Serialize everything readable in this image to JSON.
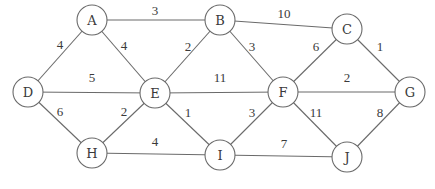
{
  "graph": {
    "type": "undirected-weighted",
    "node_radius": 15,
    "colors": {
      "stroke": "#6a6a6a",
      "text": "#3a3a3a",
      "background": "#ffffff"
    },
    "nodes": [
      {
        "id": "A",
        "x": 92,
        "y": 20
      },
      {
        "id": "B",
        "x": 220,
        "y": 20
      },
      {
        "id": "C",
        "x": 347,
        "y": 29
      },
      {
        "id": "D",
        "x": 28,
        "y": 92
      },
      {
        "id": "E",
        "x": 155,
        "y": 93
      },
      {
        "id": "F",
        "x": 283,
        "y": 92
      },
      {
        "id": "G",
        "x": 410,
        "y": 92
      },
      {
        "id": "H",
        "x": 92,
        "y": 153
      },
      {
        "id": "I",
        "x": 220,
        "y": 155
      },
      {
        "id": "J",
        "x": 347,
        "y": 157
      }
    ],
    "edges": [
      {
        "from": "A",
        "to": "B",
        "weight": "3",
        "lx": 155,
        "ly": 15
      },
      {
        "from": "A",
        "to": "D",
        "weight": "4",
        "lx": 60,
        "ly": 49
      },
      {
        "from": "A",
        "to": "E",
        "weight": "4",
        "lx": 124,
        "ly": 50
      },
      {
        "from": "B",
        "to": "C",
        "weight": "10",
        "lx": 284,
        "ly": 18
      },
      {
        "from": "B",
        "to": "E",
        "weight": "2",
        "lx": 188,
        "ly": 51
      },
      {
        "from": "B",
        "to": "F",
        "weight": "3",
        "lx": 252,
        "ly": 51
      },
      {
        "from": "C",
        "to": "F",
        "weight": "6",
        "lx": 316,
        "ly": 51
      },
      {
        "from": "C",
        "to": "G",
        "weight": "1",
        "lx": 380,
        "ly": 51
      },
      {
        "from": "D",
        "to": "E",
        "weight": "5",
        "lx": 92,
        "ly": 82
      },
      {
        "from": "E",
        "to": "F",
        "weight": "11",
        "lx": 220,
        "ly": 82
      },
      {
        "from": "F",
        "to": "G",
        "weight": "2",
        "lx": 347,
        "ly": 82
      },
      {
        "from": "D",
        "to": "H",
        "weight": "6",
        "lx": 60,
        "ly": 116
      },
      {
        "from": "E",
        "to": "H",
        "weight": "2",
        "lx": 124,
        "ly": 116
      },
      {
        "from": "E",
        "to": "I",
        "weight": "1",
        "lx": 188,
        "ly": 117
      },
      {
        "from": "F",
        "to": "I",
        "weight": "3",
        "lx": 252,
        "ly": 117
      },
      {
        "from": "F",
        "to": "J",
        "weight": "11",
        "lx": 316,
        "ly": 117
      },
      {
        "from": "G",
        "to": "J",
        "weight": "8",
        "lx": 380,
        "ly": 117
      },
      {
        "from": "H",
        "to": "I",
        "weight": "4",
        "lx": 155,
        "ly": 146
      },
      {
        "from": "I",
        "to": "J",
        "weight": "7",
        "lx": 284,
        "ly": 148
      }
    ]
  }
}
